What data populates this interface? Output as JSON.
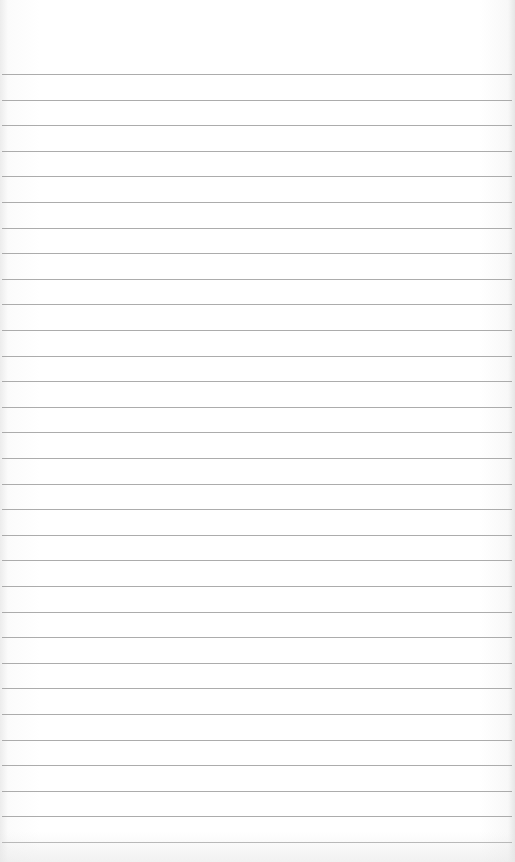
{
  "page": {
    "type": "lined-paper",
    "background_color": "#ffffff",
    "line_color": "#9e9e9e",
    "first_line_y": 74,
    "line_spacing": 25.6,
    "line_count": 31,
    "text": ""
  }
}
